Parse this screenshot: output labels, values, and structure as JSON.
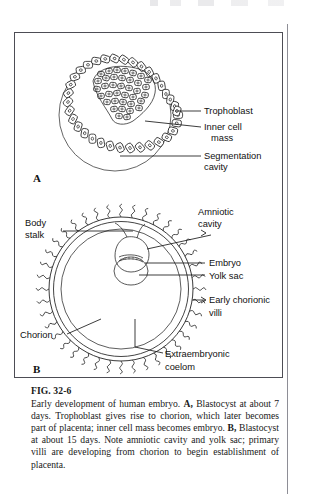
{
  "figure": {
    "number": "FIG. 32-6",
    "caption_parts": {
      "p1": "Early development of human embryo. ",
      "bold_a": "A,",
      "p2": " Blastocyst at about 7 days. Trophoblast gives rise to chorion, which later becomes part of placenta; inner cell mass becomes embryo. ",
      "bold_b": "B,",
      "p3": " Blastocyst at about 15 days. Note amniotic cavity and yolk sac; primary villi are developing from chorion to begin establishment of placenta."
    },
    "panels": [
      {
        "letter": "A",
        "name": "blastocyst-7-days",
        "labels": [
          {
            "id": "trophoblast",
            "text": "Trophoblast"
          },
          {
            "id": "inner-cell-mass-line1",
            "text": "Inner cell"
          },
          {
            "id": "inner-cell-mass-line2",
            "text": "mass"
          },
          {
            "id": "segmentation-cavity-line1",
            "text": "Segmentation"
          },
          {
            "id": "segmentation-cavity-line2",
            "text": "cavity"
          }
        ]
      },
      {
        "letter": "B",
        "name": "blastocyst-15-days",
        "labels": [
          {
            "id": "body-stalk-line1",
            "text": "Body"
          },
          {
            "id": "body-stalk-line2",
            "text": "stalk"
          },
          {
            "id": "amniotic-cavity-line1",
            "text": "Amniotic"
          },
          {
            "id": "amniotic-cavity-line2",
            "text": "cavity"
          },
          {
            "id": "embryo",
            "text": "Embryo"
          },
          {
            "id": "yolk-sac",
            "text": "Yolk sac"
          },
          {
            "id": "early-chorionic-villi-line1",
            "text": "Early chorionic"
          },
          {
            "id": "early-chorionic-villi-line2",
            "text": "villi"
          },
          {
            "id": "chorion",
            "text": "Chorion"
          },
          {
            "id": "extraembryonic-coelom-line1",
            "text": "Extraembryonic"
          },
          {
            "id": "extraembryonic-coelom-line2",
            "text": "coelom"
          }
        ]
      }
    ]
  },
  "colors": {
    "ink": "#111111",
    "frame": "#4d4d55",
    "rule": "#8e8e96",
    "paper": "#ffffff"
  }
}
